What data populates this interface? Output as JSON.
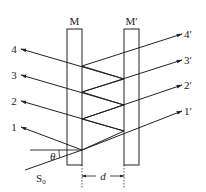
{
  "diagram": {
    "plates": [
      {
        "label": "M"
      },
      {
        "label": "M′"
      }
    ],
    "reflected_beams": [
      "1",
      "2",
      "3",
      "4"
    ],
    "transmitted_beams": [
      "1′",
      "2′",
      "3′",
      "4′"
    ],
    "source_label": "S",
    "source_subscript": "0",
    "angle_label": "θ",
    "gap_label": "d",
    "line_color": "#222222"
  }
}
